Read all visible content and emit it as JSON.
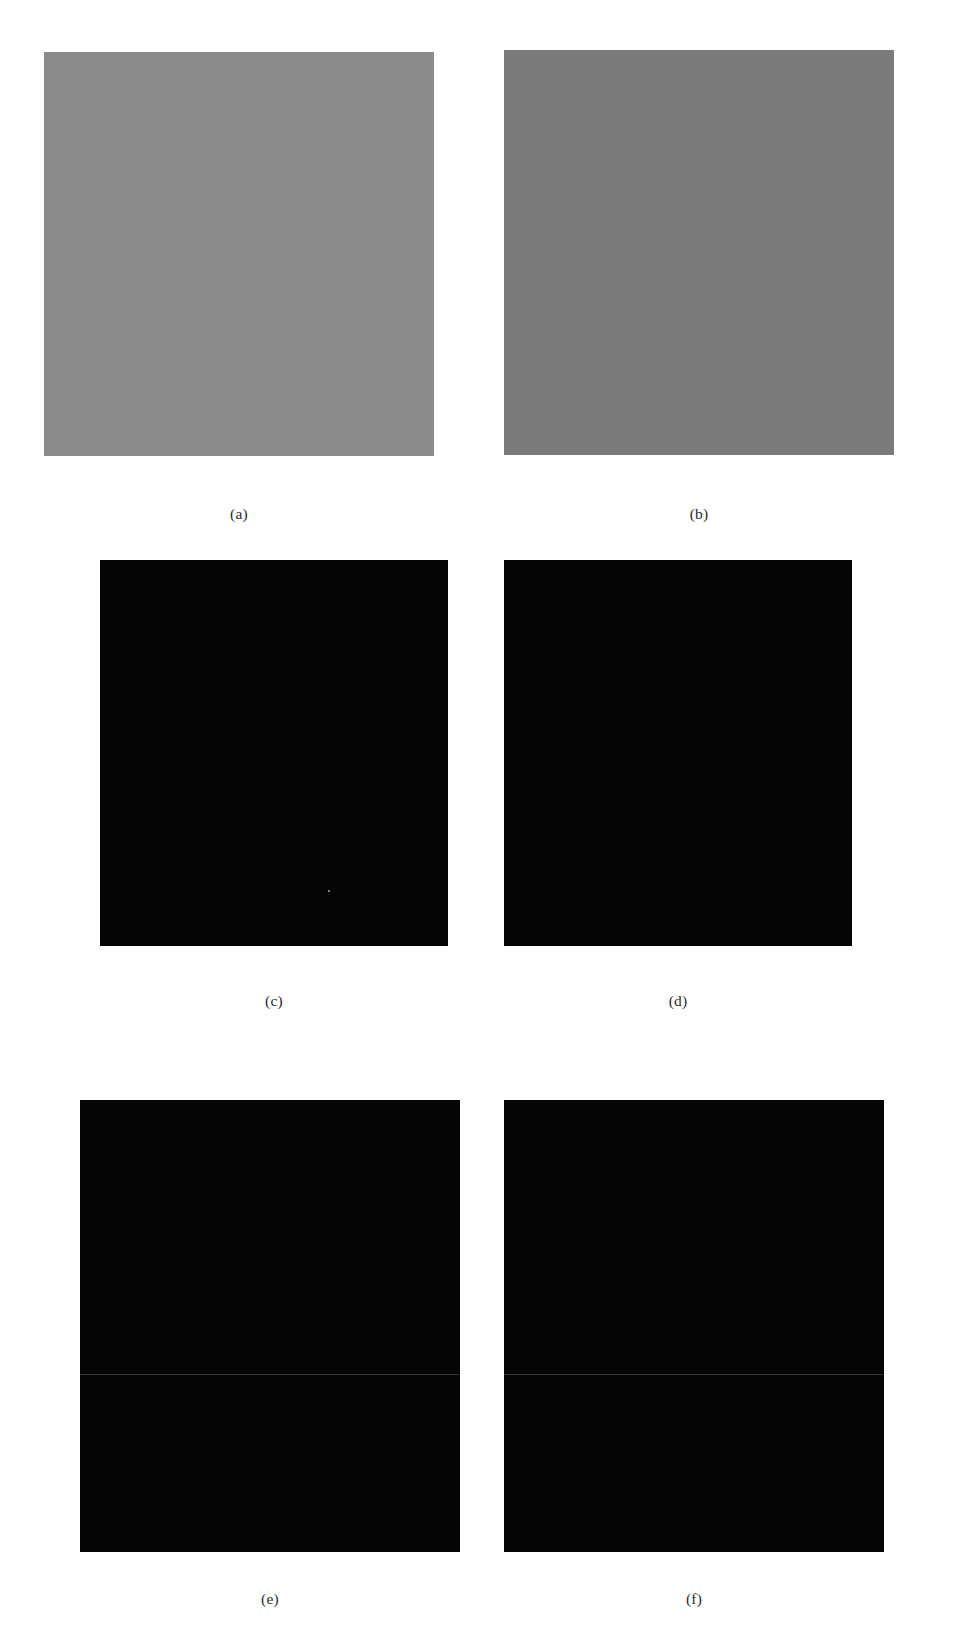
{
  "figure": {
    "type": "multi-panel-image-figure",
    "background_color": "#ffffff",
    "panel_count": 6,
    "grid": {
      "columns": 2,
      "rows": 3
    },
    "caption_font_color": "#2b2b2b"
  },
  "panels": [
    {
      "id": "a",
      "caption": "(a)",
      "kind": "noisy-gray",
      "description": "Noisy low-contrast grayscale image of Saturn on mid-gray background",
      "background_color": "#8b8b8b",
      "noise_level": "high",
      "x": 44,
      "y": 52,
      "width": 390,
      "height": 404,
      "caption_x": 239,
      "caption_y": 513
    },
    {
      "id": "b",
      "caption": "(b)",
      "kind": "noisy-gray",
      "description": "Noisier, higher-contrast grayscale image of Saturn on dark-gray background",
      "background_color": "#6f6f6f",
      "noise_level": "very-high",
      "x": 504,
      "y": 50,
      "width": 390,
      "height": 404,
      "caption_x": 699,
      "caption_y": 513
    },
    {
      "id": "c",
      "caption": "(c)",
      "kind": "restored-sharp",
      "description": "Restored sharp image of Saturn with resolved ring gap on black background",
      "background_color": "#050505",
      "noise_level": "low",
      "x": 100,
      "y": 560,
      "width": 348,
      "height": 386,
      "caption_x": 274,
      "caption_y": 1000
    },
    {
      "id": "d",
      "caption": "(d)",
      "kind": "restored-sharp",
      "description": "Restored sharp image of Saturn, slightly softer rings, on black background",
      "background_color": "#050505",
      "noise_level": "low",
      "x": 504,
      "y": 560,
      "width": 348,
      "height": 386,
      "caption_x": 678,
      "caption_y": 1000
    },
    {
      "id": "e",
      "caption": "(e)",
      "kind": "blurred",
      "description": "Heavily blurred image of Saturn on black background with faint horizontal scan line",
      "background_color": "#050505",
      "noise_level": "low",
      "x": 80,
      "y": 1100,
      "width": 380,
      "height": 452,
      "caption_x": 244,
      "caption_y": 1598
    },
    {
      "id": "f",
      "caption": "(f)",
      "kind": "blurred",
      "description": "Heavily blurred image of Saturn on black background, brighter core",
      "background_color": "#050505",
      "noise_level": "low",
      "x": 504,
      "y": 1100,
      "width": 380,
      "height": 452,
      "caption_x": 690,
      "caption_y": 1598
    }
  ]
}
